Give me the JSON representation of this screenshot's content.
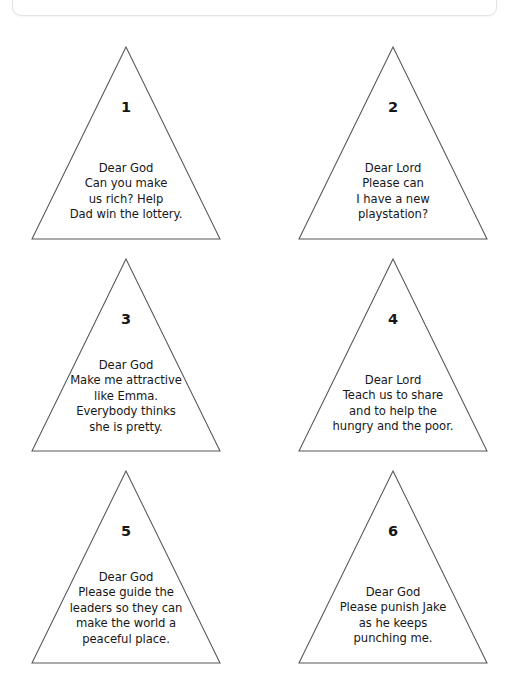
{
  "page": {
    "background_color": "#ffffff",
    "width": 509,
    "height": 694,
    "outline_color": "#53565a",
    "text_color": "#171717"
  },
  "top_card": {
    "border_color": "#e3e3e3"
  },
  "worksheet": {
    "triangles": [
      {
        "number": "1",
        "text": "Dear God\nCan you make\nus rich? Help\nDad win the lottery."
      },
      {
        "number": "2",
        "text": "Dear Lord\nPlease can\nI have a new\nplaystation?"
      },
      {
        "number": "3",
        "text": "Dear God\nMake me attractive\nlike Emma.\nEverybody thinks\nshe is pretty."
      },
      {
        "number": "4",
        "text": "Dear Lord\nTeach us to share\nand to help the\nhungry and the poor."
      },
      {
        "number": "5",
        "text": "Dear God\nPlease guide the\nleaders so they can\nmake the world a\npeaceful place."
      },
      {
        "number": "6",
        "text": "Dear God\nPlease punish Jake\nas he keeps\npunching me."
      }
    ]
  }
}
